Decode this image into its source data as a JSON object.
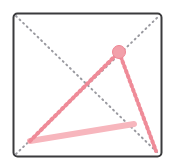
{
  "figure": {
    "name": "geometry-diagram",
    "canvas": {
      "width": 174,
      "height": 167,
      "background": "#ffffff"
    },
    "panel": {
      "label": "square-frame",
      "x": 13.5,
      "y": 13.5,
      "width": 148,
      "height": 143,
      "corner_radius": 4,
      "stroke": "#3a3a3c",
      "stroke_width": 2,
      "fill": "#ffffff"
    },
    "diagonals": [
      {
        "label": "diagonal-tl-br",
        "x1": 16,
        "y1": 16,
        "x2": 159,
        "y2": 154,
        "stroke": "#9a9aa0",
        "stroke_width": 2,
        "dash": "1 4",
        "style": "dotted"
      },
      {
        "label": "diagonal-bl-tr",
        "x1": 16,
        "y1": 154,
        "x2": 159,
        "y2": 16,
        "stroke": "#9a9aa0",
        "stroke_width": 2,
        "dash": "1 4",
        "style": "dotted"
      }
    ],
    "highlight_paths": [
      {
        "label": "pink-ray-lower-left",
        "x1": 30,
        "y1": 141,
        "x2": 119,
        "y2": 52,
        "stroke": "#ef8b98",
        "stroke_width": 4,
        "dash": "2 3",
        "style": "dotted"
      },
      {
        "label": "pink-ray-to-bottom-right",
        "x1": 119,
        "y1": 52,
        "x2": 156,
        "y2": 151,
        "stroke": "#ef8b98",
        "stroke_width": 4,
        "dash": "2 3",
        "style": "dotted"
      },
      {
        "label": "pale-pink-chord",
        "x1": 30,
        "y1": 141,
        "x2": 134,
        "y2": 124,
        "stroke": "#f7b6bd",
        "stroke_width": 6,
        "dash": "none",
        "style": "solid"
      }
    ],
    "markers": [
      {
        "label": "vertex-point",
        "cx": 119,
        "cy": 52,
        "r": 6.5,
        "fill": "#f2a0aa",
        "stroke": "#ee8694",
        "stroke_width": 1
      }
    ],
    "colors": {
      "frame_stroke": "#3a3a3c",
      "guide_dotted": "#9a9aa0",
      "accent_pink": "#ef8b98",
      "accent_pale_pink": "#f7b6bd",
      "marker_fill": "#f2a0aa",
      "background": "#ffffff"
    }
  }
}
